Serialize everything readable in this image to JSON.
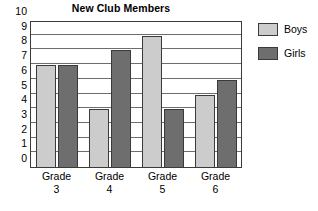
{
  "chart_data": {
    "type": "bar",
    "title": "New Club Members",
    "xlabel": "",
    "ylabel": "",
    "categories": [
      "Grade 3",
      "Grade 4",
      "Grade 5",
      "Grade 6"
    ],
    "category_lines": [
      {
        "line1": "Grade",
        "line2": "3"
      },
      {
        "line1": "Grade",
        "line2": "4"
      },
      {
        "line1": "Grade",
        "line2": "5"
      },
      {
        "line1": "Grade",
        "line2": "6"
      }
    ],
    "series": [
      {
        "name": "Boys",
        "color": "#cccccc",
        "values": [
          7,
          4,
          9,
          5
        ]
      },
      {
        "name": "Girls",
        "color": "#6e6e6e",
        "values": [
          7,
          8,
          4,
          6
        ]
      }
    ],
    "ylim": [
      0,
      10
    ],
    "y_ticks": [
      0,
      1,
      2,
      3,
      4,
      5,
      6,
      7,
      8,
      9,
      10
    ],
    "y_tick_labels": [
      "0",
      "1",
      "2",
      "3",
      "4",
      "5",
      "6",
      "7",
      "8",
      "9",
      "10"
    ],
    "grid": true,
    "grid_axis": "y",
    "legend_position": "right",
    "legend": [
      {
        "label": "Boys",
        "color": "#cccccc"
      },
      {
        "label": "Girls",
        "color": "#6e6e6e"
      }
    ]
  },
  "colors": {
    "boys": "#cccccc",
    "girls": "#6e6e6e",
    "axis": "#3b3b3b",
    "grid": "#6d6d6d",
    "background": "#ffffff",
    "text": "#000000"
  }
}
